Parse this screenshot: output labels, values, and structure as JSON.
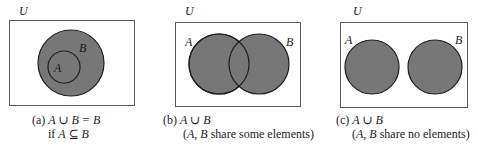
{
  "colors": {
    "set_fill": "#777777",
    "set_stroke": "#1f1f1f",
    "universe_stroke": "#5a5a5a"
  },
  "panels": [
    {
      "id": "a",
      "universe_label": "U",
      "set_labels": {
        "A": "A",
        "B": "B"
      },
      "relationship": "A is a subset of B",
      "caption": {
        "line1_prefix": "(a) ",
        "line1_math": "A ∪ B = B",
        "line2_prefix": "if ",
        "line2_math": "A ⊆ B"
      }
    },
    {
      "id": "b",
      "universe_label": "U",
      "set_labels": {
        "A": "A",
        "B": "B"
      },
      "relationship": "A and B overlap",
      "caption": {
        "line1_prefix": "(b) ",
        "line1_math": "A ∪ B",
        "line2_open": "(",
        "line2_sets": "A, B",
        "line2_text": " share some elements)"
      }
    },
    {
      "id": "c",
      "universe_label": "U",
      "set_labels": {
        "A": "A",
        "B": "B"
      },
      "relationship": "A and B are disjoint",
      "caption": {
        "line1_prefix": "(c) ",
        "line1_math": "A ∪ B",
        "line2_open": "(",
        "line2_sets": "A, B",
        "line2_text": " share no elements)"
      }
    }
  ]
}
